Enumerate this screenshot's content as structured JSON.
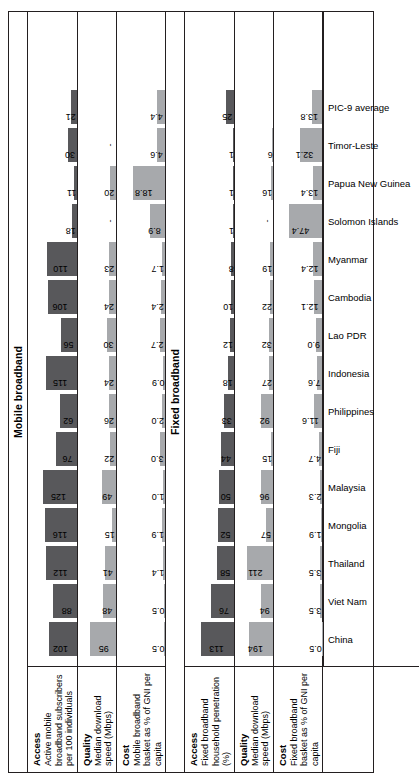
{
  "figure": {
    "sections": [
      {
        "id": "mobile-broadband",
        "title": "Mobile broadband",
        "rows": [
          {
            "id": "mobile-access",
            "name": "Access",
            "desc": "Active mobile broadband subscribers per 100 individuals",
            "shade": "dark",
            "max": 135,
            "values": [
              "102",
              "88",
              "112",
              "116",
              "125",
              "76",
              "62",
              "115",
              "56",
              "106",
              "110",
              "18",
              "11",
              "30",
              "21"
            ]
          },
          {
            "id": "mobile-quality",
            "name": "Quality",
            "desc": "Median download speed (Mbps)",
            "shade": "light",
            "max": 105,
            "values": [
              "95",
              "48",
              "41",
              "15",
              "49",
              "22",
              "26",
              "24",
              "30",
              "24",
              "23",
              "-",
              "20",
              "-",
              ""
            ]
          },
          {
            "id": "mobile-cost",
            "name": "Cost",
            "desc": "Mobile broadband basket as % of GNI per capita",
            "shade": "light",
            "max": 21,
            "values": [
              "0.5",
              "0.5",
              "1.4",
              "1.9",
              "1.0",
              "3.0",
              "2.0",
              "0.9",
              "2.7",
              "2.4",
              "1.7",
              "8.9",
              "18.8",
              "4.6",
              "4.4"
            ]
          }
        ]
      },
      {
        "id": "fixed-broadband",
        "title": "Fixed broadband",
        "rows": [
          {
            "id": "fixed-access",
            "name": "Access",
            "desc": "Fixed broadband household penetration (%)",
            "shade": "dark",
            "max": 125,
            "values": [
              "113",
              "76",
              "58",
              "52",
              "50",
              "44",
              "33",
              "18",
              "12",
              "10",
              "8",
              "1",
              "1",
              "1",
              "25"
            ]
          },
          {
            "id": "fixed-quality",
            "name": "Quality",
            "desc": "Median download speed (Mbps)",
            "shade": "light",
            "max": 230,
            "values": [
              "194",
              "94",
              "211",
              "57",
              "96",
              "15",
              "92",
              "27",
              "32",
              "22",
              "19",
              "-",
              "16",
              "6",
              ""
            ]
          },
          {
            "id": "fixed-cost",
            "name": "Cost",
            "desc": "Fixed broadband basket as % of GNI per capita",
            "shade": "light",
            "max": 52,
            "values": [
              "0.5",
              "3.5",
              "3.5",
              "1.9",
              "2.3",
              "4.7",
              "11.6",
              "7.6",
              "9.0",
              "12.1",
              "12.4",
              "47.4",
              "13.4",
              "32.1",
              "13.8"
            ]
          }
        ]
      }
    ],
    "categories": [
      "China",
      "Viet Nam",
      "Thailand",
      "Mongolia",
      "Malaysia",
      "Fiji",
      "Philippines",
      "Indonesia",
      "Lao PDR",
      "Cambodia",
      "Myanmar",
      "Solomon Islands",
      "Papua New Guinea",
      "Timor-Leste",
      "PIC-9 average"
    ],
    "colors": {
      "bar_dark": "#58585b",
      "bar_light": "#a7a9ac",
      "rule": "#231f20"
    }
  },
  "chart_data": {
    "type": "bar",
    "xlabel": "",
    "ylabel": "",
    "grid": false,
    "legend": "none",
    "categories": [
      "China",
      "Viet Nam",
      "Thailand",
      "Mongolia",
      "Malaysia",
      "Fiji",
      "Philippines",
      "Indonesia",
      "Lao PDR",
      "Cambodia",
      "Myanmar",
      "Solomon Islands",
      "Papua New Guinea",
      "Timor-Leste",
      "PIC-9 average"
    ],
    "panels": [
      {
        "group": "Mobile broadband",
        "metric": "Access",
        "description": "Active mobile broadband subscribers per 100 individuals",
        "values": [
          102,
          88,
          112,
          116,
          125,
          76,
          62,
          115,
          56,
          106,
          110,
          18,
          11,
          30,
          21
        ]
      },
      {
        "group": "Mobile broadband",
        "metric": "Quality",
        "description": "Median download speed (Mbps)",
        "values": [
          95,
          48,
          41,
          15,
          49,
          22,
          26,
          24,
          30,
          24,
          23,
          null,
          20,
          null,
          null
        ]
      },
      {
        "group": "Mobile broadband",
        "metric": "Cost",
        "description": "Mobile broadband basket as % of GNI per capita",
        "values": [
          0.5,
          0.5,
          1.4,
          1.9,
          1.0,
          3.0,
          2.0,
          0.9,
          2.7,
          2.4,
          1.7,
          8.9,
          18.8,
          4.6,
          4.4
        ]
      },
      {
        "group": "Fixed broadband",
        "metric": "Access",
        "description": "Fixed broadband household penetration (%)",
        "values": [
          113,
          76,
          58,
          52,
          50,
          44,
          33,
          18,
          12,
          10,
          8,
          1,
          1,
          1,
          25
        ]
      },
      {
        "group": "Fixed broadband",
        "metric": "Quality",
        "description": "Median download speed (Mbps)",
        "values": [
          194,
          94,
          211,
          57,
          96,
          15,
          92,
          27,
          32,
          22,
          19,
          null,
          16,
          6,
          null
        ]
      },
      {
        "group": "Fixed broadband",
        "metric": "Cost",
        "description": "Fixed broadband basket as % of GNI per capita",
        "values": [
          0.5,
          3.5,
          3.5,
          1.9,
          2.3,
          4.7,
          11.6,
          7.6,
          9.0,
          12.1,
          12.4,
          47.4,
          13.4,
          32.1,
          13.8
        ]
      }
    ]
  }
}
